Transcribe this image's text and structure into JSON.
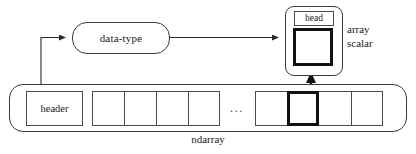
{
  "diagram": {
    "nodes": {
      "data_type": {
        "label": "data-type"
      },
      "array_scalar": {
        "head_label": "head",
        "caption_line1": "array",
        "caption_line2": "scalar"
      },
      "ndarray": {
        "caption": "ndarray",
        "header_label": "header",
        "ellipsis": "...",
        "left_cells": [
          "",
          "",
          "",
          ""
        ],
        "right_cells": [
          "",
          "",
          "",
          ""
        ],
        "highlighted_right_cell_index": 1
      }
    },
    "edges": [
      {
        "name": "header-to-datatype",
        "from": "header",
        "to": "data-type",
        "style": "elbow-arrow"
      },
      {
        "name": "datatype-to-arrayscalar",
        "from": "data-type",
        "to": "array-scalar",
        "style": "straight-arrow"
      },
      {
        "name": "element-to-arrayscalar",
        "from": "highlighted-element",
        "to": "array-scalar",
        "style": "vertical-thick-arrow"
      }
    ],
    "colors": {
      "stroke": "#3a3a3a",
      "stroke_bold": "#111111",
      "background": "#ffffff",
      "text": "#1a1a1a"
    }
  }
}
